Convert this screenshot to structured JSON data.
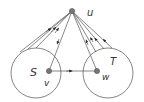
{
  "diagram": {
    "type": "graph-cut",
    "colors": {
      "line": "#555555",
      "node": "#777777",
      "text": "#333333",
      "background": "#ffffff"
    },
    "nodes": {
      "u": {
        "label": "u",
        "x": 72,
        "y": 11
      },
      "v": {
        "label": "v",
        "x": 49,
        "y": 71
      },
      "w": {
        "label": "w",
        "x": 97,
        "y": 71
      }
    },
    "sets": {
      "S": {
        "label": "S",
        "cx": 36,
        "cy": 73,
        "r": 25
      },
      "T": {
        "label": "T",
        "cx": 108,
        "cy": 73,
        "r": 25
      }
    },
    "edges": [
      {
        "from": "S",
        "to": "u",
        "count": 3
      },
      {
        "from": "u",
        "to": "v",
        "count": 1
      },
      {
        "from": "T",
        "to": "u",
        "count": 4
      },
      {
        "from": "v",
        "to": "w",
        "count": 1
      }
    ]
  }
}
